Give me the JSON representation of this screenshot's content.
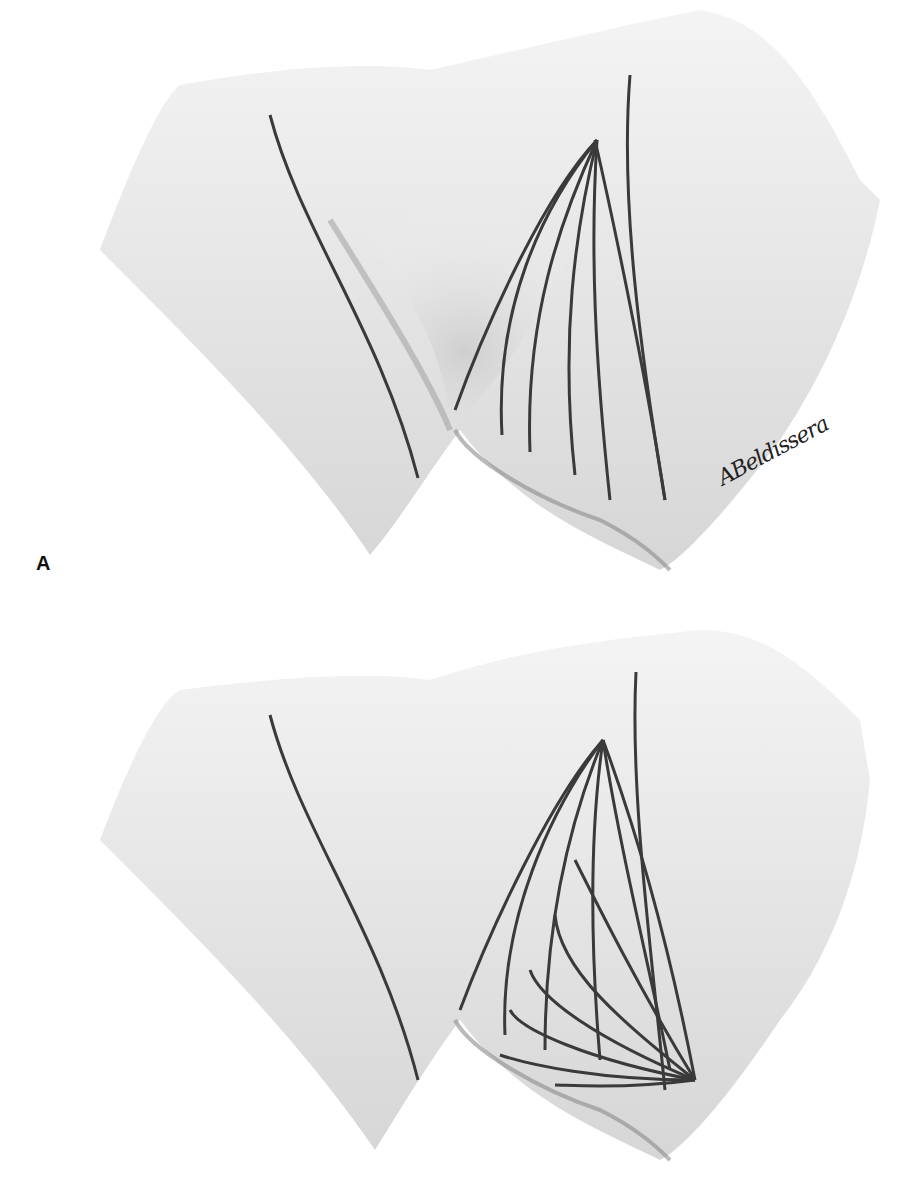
{
  "figure": {
    "panels": [
      {
        "id": "A",
        "label": "A",
        "signature": "ABeldissera",
        "description": "Pelvic/perineal illustration with fan of curved incision lines converging at a single superior apex"
      },
      {
        "id": "B",
        "label": "",
        "signature": "ABeldissera",
        "description": "Same region with converging lines plus crossing lines fanning from an inferior-lateral apex"
      }
    ],
    "colors": {
      "background": "#ffffff",
      "shading": "#c8c8c8",
      "lines": "#3a3a3a"
    }
  }
}
